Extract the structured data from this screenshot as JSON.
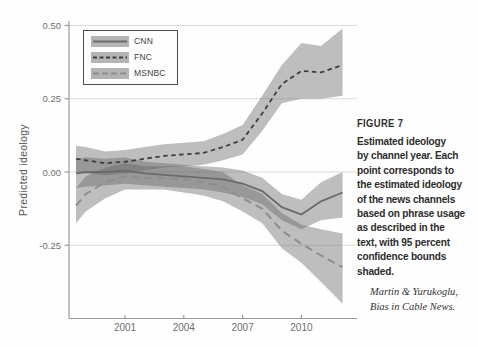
{
  "caption": {
    "heading": "FIGURE 7",
    "lines": [
      "Estimated ideology",
      "by channel year. Each",
      "point corresponds to",
      "the estimated ideology",
      "of the news channels",
      "based on phrase usage",
      "as described in the",
      "text, with 95 percent",
      "confidence bounds",
      "shaded."
    ],
    "attribution": [
      "Martin & Yurukoglu,",
      "Bias in Cable News."
    ]
  },
  "chart_data": {
    "type": "line",
    "title": "",
    "xlabel": "",
    "ylabel": "Predicted ideology",
    "xlim": [
      1998.1,
      2012.8
    ],
    "ylim": [
      -0.5,
      0.52
    ],
    "grid": "horizontal",
    "legend_position": "top-left",
    "note": "95 percent confidence bounds shaded",
    "xticks": [
      {
        "value": 2001,
        "label": "2001"
      },
      {
        "value": 2004,
        "label": "2004"
      },
      {
        "value": 2007,
        "label": "2007"
      },
      {
        "value": 2010,
        "label": "2010"
      }
    ],
    "yticks": [
      {
        "value": 0.5,
        "label": "0.50"
      },
      {
        "value": 0.25,
        "label": "0.25"
      },
      {
        "value": 0.0,
        "label": "0.00"
      },
      {
        "value": -0.25,
        "label": "-0.25"
      }
    ],
    "x": [
      1998.5,
      1999,
      2000,
      2001,
      2002,
      2003,
      2004,
      2005,
      2006,
      2007,
      2008,
      2009,
      2010,
      2011,
      2012.1
    ],
    "band_color": "#606060",
    "band_opacity": 0.4,
    "series": [
      {
        "name": "CNN",
        "style": "solid",
        "color": "#6a6a6a",
        "width": 1.8,
        "values": [
          -0.005,
          0.0,
          0.0,
          0.005,
          -0.005,
          -0.01,
          -0.015,
          -0.02,
          -0.025,
          -0.04,
          -0.065,
          -0.12,
          -0.145,
          -0.1,
          -0.07
        ],
        "lower": [
          -0.055,
          -0.05,
          -0.045,
          -0.04,
          -0.045,
          -0.05,
          -0.055,
          -0.06,
          -0.07,
          -0.085,
          -0.11,
          -0.165,
          -0.195,
          -0.165,
          -0.155
        ],
        "upper": [
          0.045,
          0.05,
          0.045,
          0.05,
          0.035,
          0.03,
          0.025,
          0.02,
          0.015,
          0.005,
          -0.02,
          -0.075,
          -0.095,
          -0.035,
          0.0
        ]
      },
      {
        "name": "FNC",
        "style": "dashed-short",
        "color": "#3f3f3f",
        "width": 1.8,
        "values": [
          0.045,
          0.04,
          0.03,
          0.035,
          0.045,
          0.055,
          0.06,
          0.065,
          0.085,
          0.11,
          0.2,
          0.3,
          0.345,
          0.34,
          0.365
        ],
        "lower": [
          0.0,
          -0.005,
          -0.01,
          -0.005,
          0.005,
          0.015,
          0.02,
          0.025,
          0.04,
          0.06,
          0.14,
          0.235,
          0.25,
          0.25,
          0.26
        ],
        "upper": [
          0.09,
          0.085,
          0.07,
          0.075,
          0.085,
          0.095,
          0.1,
          0.105,
          0.13,
          0.16,
          0.26,
          0.365,
          0.44,
          0.43,
          0.49
        ]
      },
      {
        "name": "MSNBC",
        "style": "dashed-long",
        "color": "#8d8d8d",
        "width": 2,
        "values": [
          -0.115,
          -0.075,
          -0.035,
          -0.015,
          -0.02,
          -0.02,
          -0.025,
          -0.035,
          -0.05,
          -0.09,
          -0.125,
          -0.2,
          -0.245,
          -0.285,
          -0.325
        ],
        "lower": [
          -0.175,
          -0.135,
          -0.09,
          -0.06,
          -0.06,
          -0.06,
          -0.07,
          -0.08,
          -0.1,
          -0.135,
          -0.175,
          -0.26,
          -0.31,
          -0.375,
          -0.45
        ],
        "upper": [
          -0.055,
          -0.015,
          0.015,
          0.03,
          0.02,
          0.02,
          0.02,
          0.01,
          0.0,
          -0.045,
          -0.075,
          -0.14,
          -0.18,
          -0.195,
          -0.21
        ]
      }
    ]
  }
}
